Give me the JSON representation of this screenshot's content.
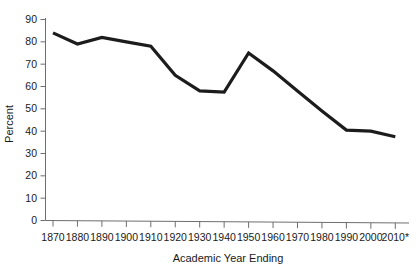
{
  "chart_data": {
    "type": "line",
    "title": "",
    "xlabel": "Academic Year Ending",
    "ylabel": "Percent",
    "categories": [
      "1870",
      "1880",
      "1890",
      "1900",
      "1910",
      "1920",
      "1930",
      "1940",
      "1950",
      "1960",
      "1970",
      "1980",
      "1990",
      "2000",
      "2010*"
    ],
    "x": [
      1870,
      1880,
      1890,
      1900,
      1910,
      1920,
      1930,
      1940,
      1950,
      1960,
      1970,
      1980,
      1990,
      2000,
      2010
    ],
    "values": [
      84,
      79,
      82,
      80,
      78,
      65,
      58,
      57.5,
      75,
      67,
      58,
      49,
      40.5,
      40,
      37.5
    ],
    "series": [
      {
        "name": "Percent",
        "values": [
          84,
          79,
          82,
          80,
          78,
          65,
          58,
          57.5,
          75,
          67,
          58,
          49,
          40.5,
          40,
          37.5
        ],
        "color": "#1c1c1c"
      }
    ],
    "ylim": [
      0,
      90
    ],
    "ytick_labels": [
      "0",
      "10",
      "20",
      "30",
      "40",
      "50",
      "60",
      "70",
      "80",
      "90"
    ],
    "ytick_values": [
      0,
      10,
      20,
      30,
      40,
      50,
      60,
      70,
      80,
      90
    ],
    "grid": false,
    "legend": "none",
    "annotations": [
      "* asterisk on final year label 2010*"
    ]
  },
  "axes": {
    "y_label": "Percent",
    "x_label": "Academic Year Ending"
  },
  "colors": {
    "line": "#1c1c1c",
    "axis": "#6e6e6e",
    "text": "#1a1a1a",
    "background": "#ffffff"
  }
}
